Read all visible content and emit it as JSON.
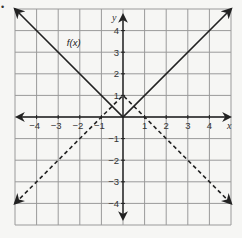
{
  "bullet": "•",
  "chart_data": {
    "type": "line",
    "title": "",
    "xlabel": "x",
    "ylabel": "y",
    "xlim": [
      -5,
      5
    ],
    "ylim": [
      -5,
      5
    ],
    "grid": true,
    "x_ticks": [
      -4,
      -3,
      -2,
      -1,
      1,
      2,
      3,
      4
    ],
    "y_ticks": [
      4,
      3,
      2,
      1,
      -1,
      -2,
      -3,
      -4
    ],
    "series": [
      {
        "name": "f(x)",
        "style": "solid",
        "equation": "y = |x|",
        "points": [
          [
            -5,
            5
          ],
          [
            0,
            0
          ],
          [
            5,
            5
          ]
        ],
        "label": "f(x)",
        "label_pos": [
          -2.6,
          3.3
        ]
      },
      {
        "name": "dashed",
        "style": "dashed",
        "equation": "y = -|x| + 1",
        "points": [
          [
            -5,
            -4
          ],
          [
            0,
            1
          ],
          [
            5,
            -4
          ]
        ]
      }
    ],
    "legend": "none"
  },
  "colors": {
    "grid": "#9a9a9a",
    "axis": "#222222",
    "line": "#222222",
    "background": "#f6f6f4"
  }
}
